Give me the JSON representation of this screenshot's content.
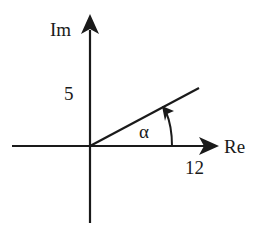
{
  "diagram": {
    "type": "complex-plane",
    "axes": {
      "imaginary_label": "Im",
      "real_label": "Re"
    },
    "ticks": {
      "imaginary_value": "5",
      "real_value": "12"
    },
    "angle_label": "α",
    "colors": {
      "stroke": "#1a1a1a",
      "background": "#ffffff"
    }
  }
}
